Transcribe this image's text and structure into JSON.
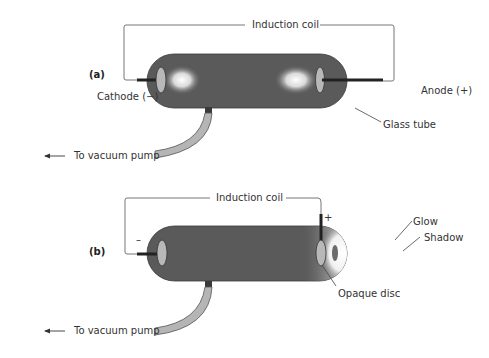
{
  "diagram": {
    "panel_a": {
      "label": "(a)",
      "coil_label": "Induction coil",
      "cathode_label": "Cathode (−)",
      "anode_label": "Anode (+)",
      "tube_label": "Glass tube",
      "pump_label": "To vacuum pump"
    },
    "panel_b": {
      "label": "(b)",
      "coil_label": "Induction coil",
      "minus_sign": "–",
      "plus_sign": "+",
      "glow_label": "Glow",
      "shadow_label": "Shadow",
      "disc_label": "Opaque disc",
      "pump_label": "To vacuum pump"
    },
    "colors": {
      "tube": "#5a5a5a",
      "electrode": "#b8b8b8",
      "pipe": "#b5b5b5",
      "glow": "#ffffff"
    }
  }
}
